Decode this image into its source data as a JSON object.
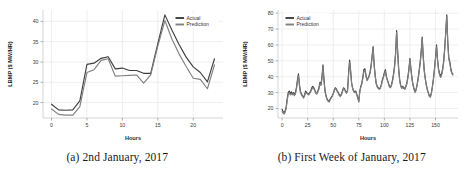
{
  "figure": {
    "panels": [
      {
        "id": "panel-a",
        "caption": "(a) 2nd January, 2017",
        "caption_tag": "(a)",
        "caption_text": "2nd January, 2017"
      },
      {
        "id": "panel-b",
        "caption": "(b) First Week of January, 2017",
        "caption_tag": "(b)",
        "caption_text": "First Week of January, 2017"
      }
    ]
  },
  "colors": {
    "actual": "#3f3f3f",
    "prediction": "#808080",
    "grid": "#e8e8e8",
    "text": "#3b3b3b",
    "background": "#ffffff"
  },
  "chart_data": [
    {
      "type": "line",
      "id": "panel-a",
      "title": "",
      "caption": "(a) 2nd January, 2017",
      "xlabel": "Hours",
      "ylabel": "LBMP ($ MW/HR)",
      "xlim": [
        -1.2,
        24.2
      ],
      "ylim": [
        16.2,
        42.8
      ],
      "xticks": [
        0,
        5,
        10,
        15,
        20
      ],
      "yticks": [
        20,
        25,
        30,
        35,
        40
      ],
      "grid": true,
      "legend_position": "upper right",
      "x": [
        0,
        1,
        2,
        3,
        4,
        5,
        6,
        7,
        8,
        9,
        10,
        11,
        12,
        13,
        14,
        15,
        16,
        17,
        18,
        19,
        20,
        21,
        22,
        23
      ],
      "series": [
        {
          "name": "Actual",
          "color": "#3f3f3f",
          "values": [
            19.6,
            18.2,
            18.1,
            18.2,
            20.4,
            29.4,
            29.7,
            30.9,
            31.3,
            28.3,
            28.5,
            27.9,
            27.9,
            27.2,
            27.2,
            34.5,
            41.6,
            37.8,
            34.3,
            31.2,
            28.8,
            27.4,
            25.1,
            30.8
          ]
        },
        {
          "name": "Prediction",
          "color": "#808080",
          "values": [
            18.4,
            17.1,
            16.9,
            16.9,
            19.0,
            27.4,
            28.1,
            30.4,
            30.8,
            26.5,
            26.6,
            26.7,
            26.8,
            24.8,
            26.8,
            33.9,
            40.2,
            35.6,
            32.0,
            28.9,
            26.0,
            25.7,
            23.4,
            29.3
          ]
        }
      ]
    },
    {
      "type": "line",
      "id": "panel-b",
      "title": "",
      "caption": "(b) First Week of January, 2017",
      "xlabel": "Hours",
      "ylabel": "LBMP ($ MW/HR)",
      "xlim": [
        -4,
        172
      ],
      "ylim": [
        14,
        82
      ],
      "xticks": [
        0,
        25,
        50,
        75,
        100,
        125,
        150
      ],
      "yticks": [
        20,
        30,
        40,
        50,
        60,
        70,
        80
      ],
      "grid": true,
      "legend_position": "upper left",
      "x": [
        0,
        1,
        2,
        3,
        4,
        5,
        6,
        7,
        8,
        9,
        10,
        11,
        12,
        13,
        14,
        15,
        16,
        17,
        18,
        19,
        20,
        21,
        22,
        23,
        24,
        25,
        26,
        27,
        28,
        29,
        30,
        31,
        32,
        33,
        34,
        35,
        36,
        37,
        38,
        39,
        40,
        41,
        42,
        43,
        44,
        45,
        46,
        47,
        48,
        49,
        50,
        51,
        52,
        53,
        54,
        55,
        56,
        57,
        58,
        59,
        60,
        61,
        62,
        63,
        64,
        65,
        66,
        67,
        68,
        69,
        70,
        71,
        72,
        73,
        74,
        75,
        76,
        77,
        78,
        79,
        80,
        81,
        82,
        83,
        84,
        85,
        86,
        87,
        88,
        89,
        90,
        91,
        92,
        93,
        94,
        95,
        96,
        97,
        98,
        99,
        100,
        101,
        102,
        103,
        104,
        105,
        106,
        107,
        108,
        109,
        110,
        111,
        112,
        113,
        114,
        115,
        116,
        117,
        118,
        119,
        120,
        121,
        122,
        123,
        124,
        125,
        126,
        127,
        128,
        129,
        130,
        131,
        132,
        133,
        134,
        135,
        136,
        137,
        138,
        139,
        140,
        141,
        142,
        143,
        144,
        145,
        146,
        147,
        148,
        149,
        150,
        151,
        152,
        153,
        154,
        155,
        156,
        157,
        158,
        159,
        160,
        161,
        162,
        163,
        164,
        165,
        166,
        167
      ],
      "series": [
        {
          "name": "Actual",
          "color": "#3f3f3f",
          "values": [
            19.5,
            18.0,
            17.5,
            18.5,
            21.0,
            26.0,
            30.0,
            31.0,
            29.0,
            30.5,
            29.0,
            30.0,
            28.5,
            30.0,
            33.0,
            38.0,
            41.8,
            35.0,
            30.5,
            29.0,
            28.0,
            27.0,
            28.5,
            31.0,
            30.0,
            29.5,
            29.0,
            30.0,
            31.0,
            33.0,
            34.0,
            33.0,
            31.5,
            30.0,
            29.5,
            31.0,
            33.0,
            36.5,
            35.0,
            40.0,
            47.5,
            38.0,
            31.0,
            28.0,
            26.0,
            25.0,
            24.5,
            26.0,
            27.0,
            28.0,
            29.5,
            31.5,
            33.0,
            32.5,
            31.0,
            30.0,
            28.5,
            28.0,
            29.0,
            31.0,
            33.0,
            32.5,
            31.0,
            30.0,
            31.5,
            42.0,
            50.5,
            44.0,
            36.0,
            33.0,
            31.0,
            30.5,
            31.0,
            29.0,
            27.0,
            24.5,
            31.0,
            34.0,
            36.0,
            40.0,
            44.5,
            45.0,
            41.0,
            38.0,
            39.0,
            40.5,
            43.0,
            47.0,
            53.0,
            59.0,
            48.0,
            41.0,
            36.0,
            34.0,
            33.0,
            32.5,
            33.0,
            35.0,
            38.0,
            40.0,
            42.5,
            44.5,
            40.0,
            38.0,
            36.0,
            34.0,
            33.5,
            35.0,
            38.0,
            42.0,
            47.0,
            55.0,
            69.0,
            56.0,
            45.0,
            38.0,
            34.5,
            33.0,
            34.0,
            33.0,
            32.5,
            34.0,
            36.0,
            40.0,
            45.0,
            51.5,
            45.0,
            39.0,
            35.0,
            32.5,
            30.5,
            32.0,
            35.0,
            39.0,
            44.0,
            49.0,
            56.0,
            65.0,
            53.0,
            44.0,
            39.0,
            35.0,
            32.0,
            30.0,
            28.0,
            27.5,
            30.0,
            34.0,
            39.0,
            45.0,
            52.0,
            60.0,
            51.0,
            45.0,
            42.0,
            40.0,
            42.0,
            45.0,
            50.0,
            58.0,
            68.0,
            79.0,
            62.0,
            52.0,
            49.5,
            45.0,
            42.5,
            41.5
          ]
        },
        {
          "name": "Prediction",
          "color": "#808080",
          "values": [
            18.0,
            17.0,
            16.5,
            17.5,
            20.0,
            25.0,
            29.0,
            30.0,
            28.5,
            29.5,
            28.5,
            29.5,
            28.0,
            29.0,
            32.0,
            37.0,
            40.5,
            34.0,
            30.0,
            28.5,
            27.5,
            26.5,
            28.0,
            30.0,
            29.5,
            29.0,
            28.5,
            29.5,
            30.5,
            32.0,
            33.0,
            32.5,
            31.0,
            29.5,
            29.0,
            30.5,
            32.0,
            35.5,
            34.5,
            39.0,
            46.0,
            37.0,
            30.5,
            27.5,
            25.5,
            24.5,
            24.0,
            25.5,
            26.5,
            27.5,
            29.0,
            31.0,
            32.5,
            32.0,
            30.5,
            29.5,
            28.0,
            27.5,
            28.5,
            30.5,
            32.5,
            32.0,
            30.5,
            29.5,
            31.0,
            41.0,
            49.0,
            43.0,
            35.5,
            32.5,
            30.5,
            30.0,
            30.5,
            28.5,
            26.5,
            24.0,
            30.5,
            33.5,
            35.5,
            39.0,
            43.5,
            44.0,
            40.5,
            37.5,
            38.5,
            40.0,
            42.0,
            46.0,
            52.0,
            58.0,
            47.0,
            40.5,
            35.5,
            33.5,
            32.5,
            32.0,
            32.5,
            34.5,
            37.0,
            39.5,
            41.5,
            43.5,
            39.5,
            37.5,
            35.5,
            33.5,
            33.0,
            34.5,
            37.0,
            41.0,
            46.0,
            54.0,
            68.0,
            55.0,
            44.0,
            37.5,
            34.0,
            32.5,
            33.5,
            32.5,
            32.0,
            33.5,
            35.5,
            39.0,
            44.0,
            50.5,
            44.0,
            38.5,
            34.5,
            32.0,
            30.0,
            31.5,
            34.5,
            38.0,
            43.0,
            48.0,
            55.0,
            64.0,
            52.0,
            43.5,
            38.5,
            34.5,
            31.5,
            29.5,
            27.5,
            27.0,
            29.5,
            33.5,
            38.0,
            44.0,
            51.0,
            59.0,
            50.0,
            44.0,
            41.0,
            39.5,
            41.0,
            44.0,
            49.0,
            57.0,
            67.0,
            78.0,
            61.0,
            51.0,
            48.5,
            44.0,
            42.0,
            41.0
          ]
        }
      ]
    }
  ]
}
